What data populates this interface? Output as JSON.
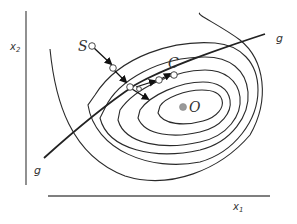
{
  "figure": {
    "axes": {
      "x_label": "x",
      "x_sub": "1",
      "y_label": "x",
      "y_sub": "2"
    },
    "points": {
      "start": "S",
      "constrained_optimum": "C",
      "unconstrained_optimum": "O"
    },
    "constraint": {
      "label_end": "g",
      "label_start": "g"
    },
    "colors": {
      "line": "#222222",
      "axis": "#555555",
      "optimum_fill": "#999999",
      "background": "#ffffff"
    }
  }
}
